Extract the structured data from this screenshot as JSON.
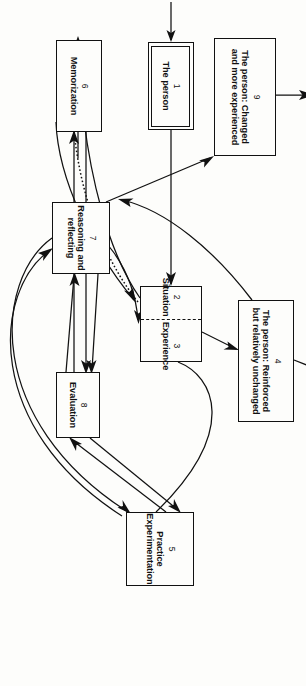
{
  "figure": {
    "type": "flow-diagram",
    "title": "",
    "orientation": "rotated-90-clockwise",
    "background_color": "#fdfdfb",
    "line_color": "#111111"
  },
  "nodes": [
    {
      "id": "node-1",
      "number": "1",
      "label": "The person",
      "style": "double-border",
      "x": 42,
      "y": 112,
      "w": 88,
      "h": 46
    },
    {
      "id": "node-2-3",
      "number": "",
      "label": "",
      "style": "split",
      "left": {
        "number": "2",
        "label": "Situation"
      },
      "right": {
        "number": "3",
        "label": "Experience"
      },
      "x": 286,
      "y": 104,
      "w": 76,
      "h": 62
    },
    {
      "id": "node-4",
      "number": "4",
      "label": "The person: Reinforced but relatively unchanged",
      "style": "plain",
      "x": 300,
      "y": 12,
      "w": 122,
      "h": 56
    },
    {
      "id": "node-5",
      "number": "5",
      "label": "Practice Experimentation",
      "style": "plain",
      "x": 512,
      "y": 112,
      "w": 74,
      "h": 68
    },
    {
      "id": "node-6",
      "number": "6",
      "label": "Memorization",
      "style": "plain",
      "x": 40,
      "y": 204,
      "w": 92,
      "h": 46
    },
    {
      "id": "node-7",
      "number": "7",
      "label": "Reasoning and reflecting",
      "style": "plain",
      "x": 202,
      "y": 196,
      "w": 72,
      "h": 58
    },
    {
      "id": "node-8",
      "number": "8",
      "label": "Evaluation",
      "style": "plain",
      "x": 372,
      "y": 206,
      "w": 66,
      "h": 44
    },
    {
      "id": "node-9",
      "number": "9",
      "label": "The person: Changed and more experienced",
      "style": "plain",
      "x": 38,
      "y": 30,
      "w": 118,
      "h": 62
    }
  ],
  "edges": [
    {
      "id": "edge-in-to-1",
      "from": "external",
      "to": "node-1",
      "style": "solid",
      "arrow": "single"
    },
    {
      "id": "edge-1-to-2",
      "from": "node-1",
      "to": "node-2-3",
      "style": "solid",
      "arrow": "single"
    },
    {
      "id": "edge-3-to-4",
      "from": "node-3",
      "to": "node-4",
      "style": "solid",
      "arrow": "single"
    },
    {
      "id": "edge-4-to-out",
      "from": "node-4",
      "to": "external",
      "style": "solid",
      "arrow": "single"
    },
    {
      "id": "edge-3-to-6",
      "from": "node-3",
      "to": "node-6",
      "style": "solid",
      "arrow": "single"
    },
    {
      "id": "edge-6-to-3",
      "from": "node-6",
      "to": "node-3",
      "style": "solid",
      "arrow": "single"
    },
    {
      "id": "edge-3-6-dotted",
      "from": "node-3",
      "to": "node-6",
      "style": "dotted",
      "arrow": "none"
    },
    {
      "id": "edge-4-to-7",
      "from": "node-4",
      "to": "node-7",
      "style": "solid",
      "arrow": "single"
    },
    {
      "id": "edge-7-to-3",
      "from": "node-7",
      "to": "node-3",
      "style": "solid",
      "arrow": "single"
    },
    {
      "id": "edge-6-to-9",
      "from": "node-6",
      "to": "node-9",
      "style": "solid",
      "arrow": "single"
    },
    {
      "id": "edge-7-to-9",
      "from": "node-7",
      "to": "node-9",
      "style": "solid",
      "arrow": "single"
    },
    {
      "id": "edge-9-to-out",
      "from": "node-9",
      "to": "external",
      "style": "solid",
      "arrow": "single"
    },
    {
      "id": "edge-6-to-8",
      "from": "node-6",
      "to": "node-8",
      "style": "solid",
      "arrow": "single"
    },
    {
      "id": "edge-8-to-6",
      "from": "node-8",
      "to": "node-6",
      "style": "solid",
      "arrow": "single"
    },
    {
      "id": "edge-7-to-8",
      "from": "node-7",
      "to": "node-8",
      "style": "solid",
      "arrow": "single"
    },
    {
      "id": "edge-8-to-7",
      "from": "node-8",
      "to": "node-7",
      "style": "solid",
      "arrow": "single"
    },
    {
      "id": "edge-8-to-5",
      "from": "node-8",
      "to": "node-5",
      "style": "solid",
      "arrow": "single"
    },
    {
      "id": "edge-5-to-8",
      "from": "node-5",
      "to": "node-8",
      "style": "solid",
      "arrow": "single"
    },
    {
      "id": "edge-7-to-5",
      "from": "node-7",
      "to": "node-5",
      "style": "solid",
      "arrow": "single"
    },
    {
      "id": "edge-5-to-7",
      "from": "node-5",
      "to": "node-7",
      "style": "solid",
      "arrow": "single"
    },
    {
      "id": "edge-5-to-3",
      "from": "node-5",
      "to": "node-2-3",
      "style": "solid",
      "arrow": "none"
    }
  ]
}
